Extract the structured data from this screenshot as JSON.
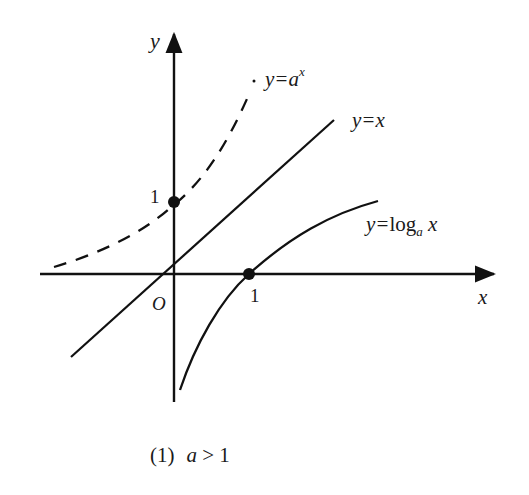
{
  "figure": {
    "caption_number": "(1)",
    "caption_condition_var": "a",
    "caption_condition_rest": " > 1",
    "colors": {
      "ink": "#111111",
      "background": "#ffffff"
    }
  },
  "axes": {
    "x_label": "x",
    "y_label": "y",
    "origin_label": "O",
    "x_tick_label": "1",
    "y_tick_label": "1"
  },
  "curves": {
    "exponential": {
      "label_prefix": "y=",
      "label_base": "a",
      "label_exp": "x",
      "style": "dashed"
    },
    "identity": {
      "label": "y=x",
      "style": "solid"
    },
    "logarithm": {
      "label_prefix": "y=",
      "label_func": "log",
      "label_sub": "a",
      "label_arg": " x",
      "style": "solid"
    }
  },
  "points": [
    {
      "name": "exp-intercept",
      "coords": "(0, 1)"
    },
    {
      "name": "log-intercept",
      "coords": "(1, 0)"
    }
  ]
}
